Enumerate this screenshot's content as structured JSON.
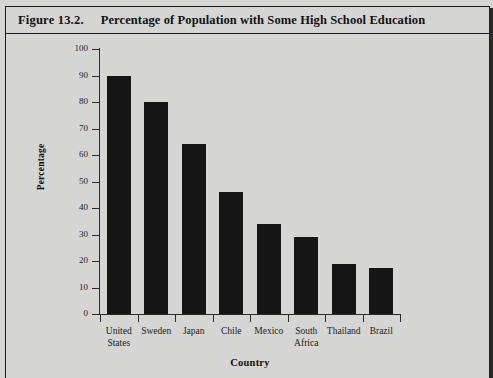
{
  "figure": {
    "number": "Figure 13.2.",
    "title": "Percentage of Population with Some High School Education"
  },
  "colors": {
    "background": "#d5d5d3",
    "bar": "#151515",
    "axis": "#2b2b2b",
    "text": "#1c1c1c",
    "border": "#1b1b1b"
  },
  "chart_data": {
    "type": "bar",
    "title": "Percentage of Population with Some High School Education",
    "xlabel": "Country",
    "ylabel": "Percentage",
    "categories": [
      "United States",
      "Sweden",
      "Japan",
      "Chile",
      "Mexico",
      "South Africa",
      "Thailand",
      "Brazil"
    ],
    "category_lines": [
      [
        "United",
        "States"
      ],
      [
        "Sweden"
      ],
      [
        "Japan"
      ],
      [
        "Chile"
      ],
      [
        "Mexico"
      ],
      [
        "South",
        "Africa"
      ],
      [
        "Thailand"
      ],
      [
        "Brazil"
      ]
    ],
    "values": [
      90,
      80,
      64,
      46,
      34,
      29,
      19,
      17.5
    ],
    "ylim": [
      0,
      100
    ],
    "ytick_labels": [
      "100",
      "90",
      "80",
      "70",
      "60",
      "50",
      "40",
      "30",
      "20",
      "10",
      "0"
    ],
    "ytick_values": [
      100,
      90,
      80,
      70,
      60,
      50,
      40,
      30,
      20,
      10,
      0
    ],
    "ytick_step": 10,
    "grid": false,
    "legend": null,
    "bar_color": "#151515"
  }
}
